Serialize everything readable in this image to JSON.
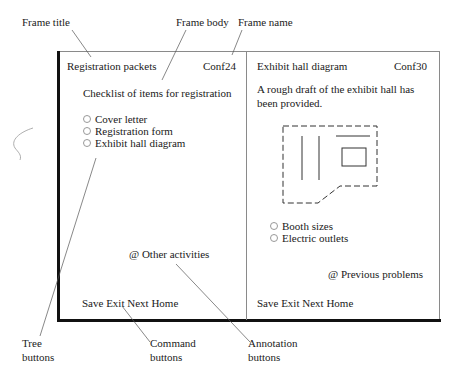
{
  "callouts": {
    "frame_title": "Frame title",
    "frame_body": "Frame body",
    "frame_name": "Frame name",
    "tree_buttons": [
      "Tree",
      "buttons"
    ],
    "command_buttons": [
      "Command",
      "buttons"
    ],
    "annotation_buttons": [
      "Annotation",
      "buttons"
    ]
  },
  "frames": [
    {
      "title": "Registration packets",
      "name": "Conf24",
      "body_text": "Checklist of items for registration",
      "tree_buttons": [
        "Cover letter",
        "Registration form",
        "Exhibit hall diagram"
      ],
      "annotation_button": "@ Other activities",
      "commands": [
        "Save",
        "Exit",
        "Next",
        "Home"
      ]
    },
    {
      "title": "Exhibit hall diagram",
      "name": "Conf30",
      "body_text": [
        "A rough draft of the exhibit hall has",
        "been provided."
      ],
      "tree_buttons": [
        "Booth sizes",
        "Electric outlets"
      ],
      "annotation_button": "@ Previous problems",
      "commands": [
        "Save",
        "Exit",
        "Next",
        "Home"
      ]
    }
  ],
  "colors": {
    "ink": "#1a1a1a",
    "frame_border": "#8a8a8a",
    "shadow": "#111111",
    "leader_line": "#555555"
  }
}
